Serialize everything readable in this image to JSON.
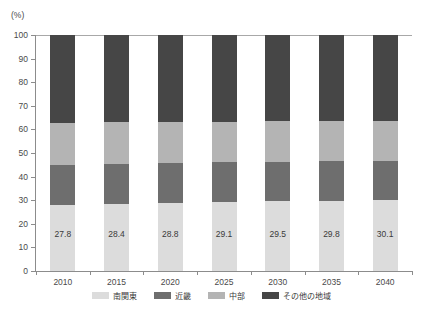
{
  "chart_data": {
    "type": "bar",
    "stacked": true,
    "stack_total": 100,
    "title": "",
    "subtitle": "",
    "xlabel": "",
    "ylabel": "",
    "unit_label": "(%)",
    "grid": false,
    "legend_position": "bottom",
    "categories": [
      "2010",
      "2015",
      "2020",
      "2025",
      "2030",
      "2035",
      "2040"
    ],
    "ylim": [
      0,
      100
    ],
    "yticks": [
      0,
      10,
      20,
      30,
      40,
      50,
      60,
      70,
      80,
      90,
      100
    ],
    "ytick_labels": [
      "0",
      "10",
      "20",
      "30",
      "40",
      "50",
      "60",
      "70",
      "80",
      "90",
      "100"
    ],
    "series": [
      {
        "name": "南関東",
        "color": "#dcdcdc",
        "values": [
          27.8,
          28.4,
          28.8,
          29.1,
          29.5,
          29.8,
          30.1
        ],
        "data_labels": [
          "27.8",
          "28.4",
          "28.8",
          "29.1",
          "29.5",
          "29.8",
          "30.1"
        ]
      },
      {
        "name": "近畿",
        "color": "#6e6e6e",
        "values": [
          17.2,
          17.1,
          17.0,
          16.9,
          16.8,
          16.6,
          16.4
        ],
        "data_labels": [
          "",
          "",
          "",
          "",
          "",
          "",
          ""
        ]
      },
      {
        "name": "中部",
        "color": "#b4b4b4",
        "values": [
          17.6,
          17.5,
          17.4,
          17.3,
          17.2,
          17.1,
          17.0
        ],
        "data_labels": [
          "",
          "",
          "",
          "",
          "",
          "",
          ""
        ]
      },
      {
        "name": "その他の地域",
        "color": "#464646",
        "values": [
          37.4,
          37.0,
          36.8,
          36.7,
          36.5,
          36.5,
          36.5
        ],
        "data_labels": [
          "",
          "",
          "",
          "",
          "",
          "",
          ""
        ]
      }
    ]
  },
  "legend": {
    "items": [
      {
        "label": "南関東",
        "color": "#dcdcdc"
      },
      {
        "label": "近畿",
        "color": "#6e6e6e"
      },
      {
        "label": "中部",
        "color": "#b4b4b4"
      },
      {
        "label": "その他の地域",
        "color": "#464646"
      }
    ]
  }
}
